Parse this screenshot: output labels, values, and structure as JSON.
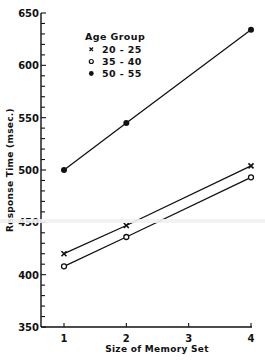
{
  "chart_data": {
    "type": "line",
    "title": "",
    "xlabel": "Size of Memory Set",
    "ylabel": "Response Time (msec.)",
    "xlim": [
      0.8,
      4
    ],
    "ylim": [
      350,
      650
    ],
    "x_ticks": [
      1,
      2,
      3,
      4
    ],
    "x_tick_labels": [
      "1",
      "2",
      "3",
      "4"
    ],
    "y_ticks": [
      350,
      400,
      450,
      500,
      550,
      600,
      650
    ],
    "y_tick_labels": [
      "350",
      "400",
      "450",
      "500",
      "550",
      "600",
      "650"
    ],
    "y_minor_step": 10,
    "grid": false,
    "legend": {
      "title": "Age Group",
      "position": "upper-left-inside",
      "entries": [
        {
          "marker": "x",
          "label": "20-25"
        },
        {
          "marker": "o",
          "label": "35-40"
        },
        {
          "marker": "●",
          "label": "50-55"
        }
      ]
    },
    "series": [
      {
        "name": "20-25",
        "marker": "x",
        "x": [
          1,
          2,
          4
        ],
        "values": [
          420,
          447,
          504
        ]
      },
      {
        "name": "35-40",
        "marker": "open-circle",
        "x": [
          1,
          2,
          4
        ],
        "values": [
          408,
          436,
          493
        ]
      },
      {
        "name": "50-55",
        "marker": "filled-circle",
        "x": [
          1,
          2,
          4
        ],
        "values": [
          500,
          545,
          634
        ]
      }
    ]
  },
  "labels": {
    "xlabel": "Size of Memory Set",
    "ylabel": "Response Time (msec.)",
    "legend_title": "Age Group",
    "legend_items": [
      {
        "symbol": "x",
        "label": "20 - 25"
      },
      {
        "symbol": "o",
        "label": "35 - 40"
      },
      {
        "symbol": "●",
        "label": "50 - 55"
      }
    ]
  }
}
